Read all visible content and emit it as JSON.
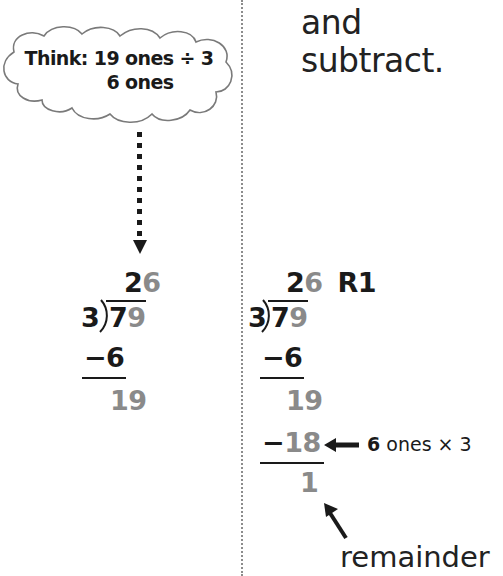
{
  "instruction": {
    "line1": "and",
    "line2": "subtract."
  },
  "think_bubble": {
    "line1": "Think: 19 ones ÷ 3",
    "line2": "6 ones"
  },
  "left_problem": {
    "quotient_tens": "2",
    "quotient_ones": "6",
    "divisor": "3",
    "dividend_tens": "7",
    "dividend_ones": "9",
    "subtract_1": "−6",
    "remainder_step": "19"
  },
  "right_problem": {
    "quotient_tens": "2",
    "quotient_ones": "6",
    "remainder_label": "R1",
    "divisor": "3",
    "dividend_tens": "7",
    "dividend_ones": "9",
    "subtract_1": "−6",
    "bring_down": "19",
    "subtract_2_minus": "−",
    "subtract_2_value": "18",
    "final_remainder": "1"
  },
  "annotations": {
    "product_bold": "6",
    "product_rest": " ones × 3",
    "remainder": "remainder"
  },
  "colors": {
    "text": "#1a1a1a",
    "highlight_gray": "#8a8a8a",
    "divider": "#8c8c8c"
  }
}
